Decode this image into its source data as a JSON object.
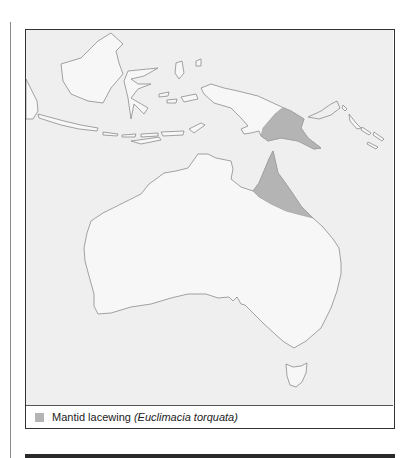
{
  "figure": {
    "legend": {
      "common_name": "Mantid lacewing ",
      "scientific_name": "(Euclimacia torquata)",
      "swatch_color": "#b4b4b4"
    },
    "map": {
      "sea_color": "#efefef",
      "land_color": "#f7f7f7",
      "coast_color": "#8c8c8c",
      "range_color": "#b4b4b4",
      "regions_shaded": [
        "Cape York Peninsula (north-east Queensland)",
        "South-eastern Papua New Guinea"
      ]
    }
  }
}
